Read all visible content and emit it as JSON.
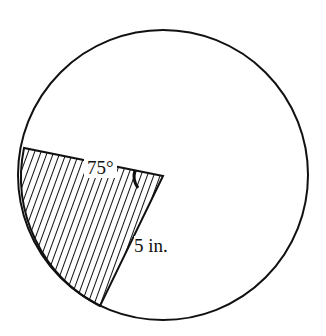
{
  "figure": {
    "angle_label": "75°",
    "radius_label": "5 in.",
    "shape": "circle with shaded sector",
    "sector_angle_deg": 75,
    "radius_in": 5,
    "colors": {
      "stroke": "#111111",
      "background": "#ffffff",
      "hatch": "#111111"
    }
  }
}
